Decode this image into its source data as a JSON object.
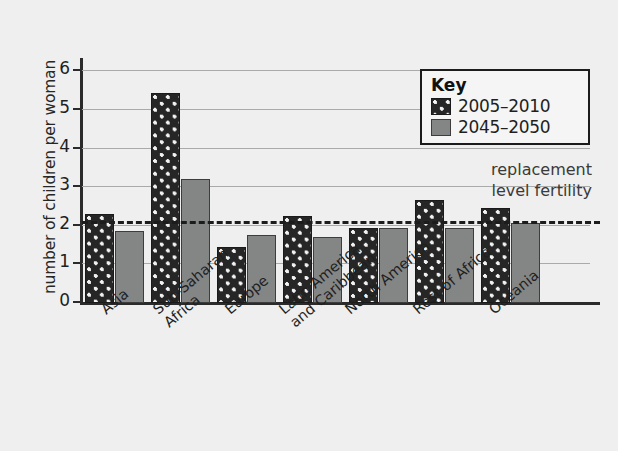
{
  "chart_data": {
    "type": "bar",
    "title": "",
    "xlabel": "",
    "ylabel": "number of children per woman",
    "ylim": [
      0,
      6.4
    ],
    "yticks": [
      0,
      1,
      2,
      3,
      4,
      5,
      6
    ],
    "ytick_labels": [
      "0",
      "1",
      "2",
      "3",
      "4",
      "5",
      "6"
    ],
    "grid": true,
    "legend_position": "top-right",
    "legend_title": "Key",
    "categories": [
      "Asia",
      "Sub-Saharan\nAfrica",
      "Europe",
      "Latin America\nand Caribbean",
      "North America",
      "Rest of Africa",
      "Oceania"
    ],
    "series": [
      {
        "name": "2005–2010",
        "color": "#262626",
        "pattern": "polka-dot",
        "values": [
          2.3,
          5.45,
          1.45,
          2.25,
          1.95,
          2.67,
          2.45
        ]
      },
      {
        "name": "2045–2050",
        "color": "#848686",
        "pattern": "solid",
        "values": [
          1.87,
          3.22,
          1.75,
          1.72,
          1.95,
          1.95,
          2.08
        ]
      }
    ],
    "annotations": [
      {
        "name": "replacement-level-fertility",
        "text": "replacement\nlevel fertility",
        "value": 2.1,
        "style": "dashed-line"
      }
    ]
  },
  "legend": {
    "title": "Key",
    "items": [
      {
        "label": "2005–2010",
        "swatch": "dark-dotted"
      },
      {
        "label": "2045–2050",
        "swatch": "gray-solid"
      }
    ]
  },
  "annotation": {
    "replacement_text": "replacement\nlevel fertility"
  },
  "axes": {
    "y_title": "number of children per woman",
    "y_ticks": [
      "0",
      "1",
      "2",
      "3",
      "4",
      "5",
      "6"
    ],
    "x_categories": [
      "Asia",
      "Sub-Saharan\nAfrica",
      "Europe",
      "Latin America\nand Caribbean",
      "North America",
      "Rest of Africa",
      "Oceania"
    ]
  }
}
